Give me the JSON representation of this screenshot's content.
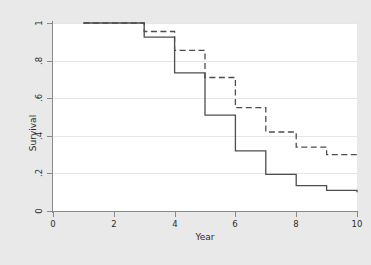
{
  "chart_data": {
    "type": "line",
    "title": "",
    "subtitle": "",
    "xlabel": "Year",
    "ylabel": "Survival",
    "xlim": [
      0,
      10
    ],
    "ylim": [
      0,
      1
    ],
    "xticks": [
      "0",
      "2",
      "4",
      "6",
      "8",
      "10"
    ],
    "xtick_values": [
      0,
      2,
      4,
      6,
      8,
      10
    ],
    "yticks": [
      "0",
      ".2",
      ".4",
      ".6",
      ".8",
      "1"
    ],
    "ytick_values": [
      0,
      0.2,
      0.4,
      0.6,
      0.8,
      1
    ],
    "grid": "horizontal",
    "legend": "none",
    "step_type": "post",
    "series": [
      {
        "name": "solid-curve",
        "style": "solid",
        "color": "#4d4d4d",
        "x": [
          1,
          3,
          4,
          5,
          6,
          7,
          8,
          9,
          10
        ],
        "values": [
          1.0,
          0.925,
          0.735,
          0.51,
          0.32,
          0.195,
          0.135,
          0.11,
          0.1
        ]
      },
      {
        "name": "dashed-curve",
        "style": "dashed",
        "color": "#4d4d4d",
        "x": [
          1,
          3,
          4,
          5,
          6,
          7,
          8,
          9,
          10
        ],
        "values": [
          1.0,
          0.955,
          0.855,
          0.71,
          0.55,
          0.42,
          0.34,
          0.3,
          0.29
        ]
      }
    ]
  },
  "figure": {
    "background_color": "#e9e9e9",
    "plot_background_color": "#ffffff",
    "axis_color": "#8a8a8a",
    "gridline_color": "#e6e6e6"
  }
}
